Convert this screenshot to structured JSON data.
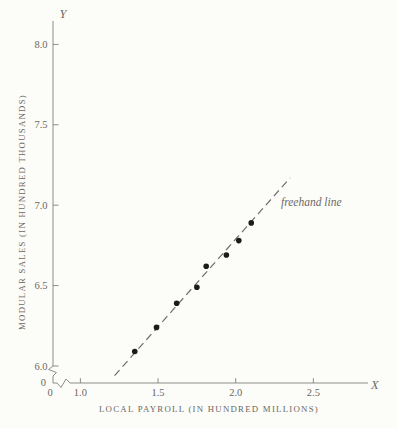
{
  "figure": {
    "background": "#fcfcf8"
  },
  "chart_data": {
    "type": "scatter",
    "title": "",
    "xlabel": "LOCAL PAYROLL (IN HUNDRED MILLIONS)",
    "ylabel": "MODULAR SALES (IN HUNDRED THOUSANDS)",
    "x_axis_symbol": "X",
    "y_axis_symbol": "Y",
    "x_origin_label": "0",
    "y_origin_label": "0",
    "grid": false,
    "legend": "none",
    "axis_breaks": {
      "x_axis": "zigzag between 0 and 1.0",
      "y_axis": "zigzag between 0 and 6.0"
    },
    "x_ticks": [
      {
        "value": 1.0,
        "label": "1.0"
      },
      {
        "value": 1.5,
        "label": "1.5"
      },
      {
        "value": 2.0,
        "label": "2.0"
      },
      {
        "value": 2.5,
        "label": "2.5"
      }
    ],
    "y_ticks": [
      {
        "value": 6.0,
        "label": "6.0"
      },
      {
        "value": 6.5,
        "label": "6.5"
      },
      {
        "value": 7.0,
        "label": "7.0"
      },
      {
        "value": 7.5,
        "label": "7.5"
      },
      {
        "value": 8.0,
        "label": "8.0"
      }
    ],
    "xlim": [
      1.0,
      2.85
    ],
    "ylim": [
      6.0,
      8.15
    ],
    "points": [
      [
        1.35,
        6.09
      ],
      [
        1.49,
        6.24
      ],
      [
        1.62,
        6.39
      ],
      [
        1.75,
        6.49
      ],
      [
        1.81,
        6.62
      ],
      [
        1.94,
        6.69
      ],
      [
        2.02,
        6.78
      ],
      [
        2.1,
        6.89
      ]
    ],
    "freehand_line": {
      "style": "dashed",
      "label": "freehand line",
      "from": [
        1.22,
        5.94
      ],
      "to": [
        2.35,
        7.17
      ]
    },
    "colors": {
      "ink": "#6b6966",
      "axis": "#8e8c88",
      "point": "#1b1b1b",
      "dash": "#6f6d6a",
      "background": "#fcfcf8"
    }
  }
}
